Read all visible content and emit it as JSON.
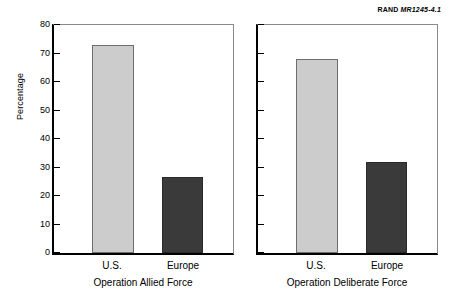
{
  "header": {
    "rand_mark": "RAND",
    "document_id": "MR1245-4.1"
  },
  "chart_data": {
    "type": "bar",
    "title": "",
    "subtitle": "",
    "xlabel": "",
    "ylabel": "Percentage",
    "ylim": [
      0,
      80
    ],
    "yticks": [
      0,
      10,
      20,
      30,
      40,
      50,
      60,
      70,
      80
    ],
    "ytick_labels": [
      "0",
      "10",
      "20",
      "30",
      "40",
      "50",
      "60",
      "70",
      "80"
    ],
    "grid": false,
    "legend": "none",
    "categories": [
      "U.S.",
      "Europe"
    ],
    "panels": [
      {
        "name": "Operation Allied Force",
        "caption": "Operation Allied Force",
        "show_ytick_labels": true,
        "bars": [
          {
            "category": "U.S.",
            "value": 73,
            "color": "#cccccc",
            "style": "light"
          },
          {
            "category": "Europe",
            "value": 26.5,
            "color": "#3a3a3a",
            "style": "dark"
          }
        ]
      },
      {
        "name": "Operation Deliberate Force",
        "caption": "Operation Deliberate Force",
        "show_ytick_labels": false,
        "bars": [
          {
            "category": "U.S.",
            "value": 68,
            "color": "#cccccc",
            "style": "light"
          },
          {
            "category": "Europe",
            "value": 32,
            "color": "#3a3a3a",
            "style": "dark"
          }
        ]
      }
    ],
    "colors": {
      "light_bar": "#cccccc",
      "dark_bar": "#3a3a3a",
      "axis": "#000000",
      "frame": "#8a8a8a",
      "background": "#ffffff"
    }
  }
}
